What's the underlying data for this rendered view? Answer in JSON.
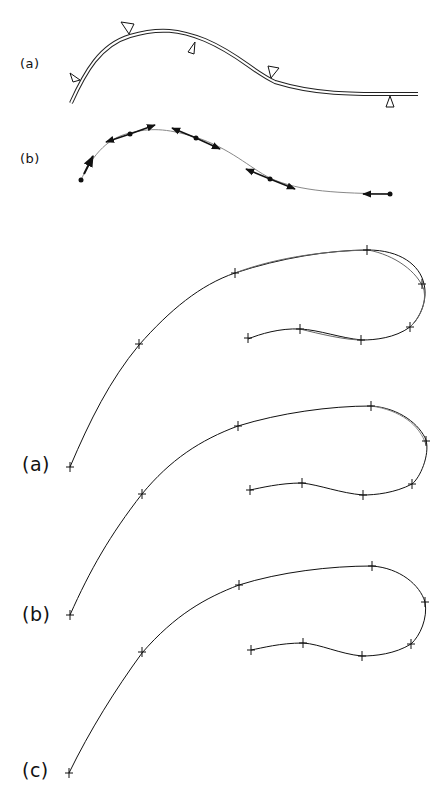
{
  "figure": {
    "top_panel": {
      "labels": {
        "a": "(a)",
        "b": "(b)"
      },
      "a_description": "Double-line elastic spline with triangular weight/support markers",
      "b_description": "Spline with control points and tangent arrows"
    },
    "bottom_panel": {
      "labels": {
        "a": "(a)",
        "b": "(b)",
        "c": "(c)"
      },
      "description": "Three hooked curves with cross-marked knot points; (a) and (b) show overlaid approximations, (c) a single smooth curve"
    }
  },
  "colors": {
    "ink": "#111111",
    "light_ink": "#888888",
    "background": "#ffffff"
  }
}
